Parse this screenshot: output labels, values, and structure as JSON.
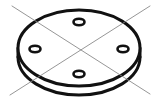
{
  "figure": {
    "title": "Circular disc with four holes",
    "background_color": "#ffffff",
    "line_color": "#111111",
    "hole_fill_color": "#ffffff",
    "construction_line_color": "#8a8a8a",
    "canvas": {
      "width": 160,
      "height": 107
    }
  },
  "disc": {
    "name": "disc-body",
    "top_face": {
      "name": "top-face-ellipse",
      "center_x": 79,
      "center_y": 48,
      "radius_x": 61,
      "radius_y": 38,
      "stroke_width": 3.0,
      "fill": "#ffffff"
    },
    "bottom_face": {
      "name": "bottom-face-arc",
      "center_x": 79,
      "center_y": 57,
      "radius_x": 61,
      "radius_y": 38,
      "stroke_width": 3.0
    },
    "thickness_px": 9,
    "side_wall_left_x": 18,
    "side_wall_right_x": 140
  },
  "holes": [
    {
      "name": "hole-top",
      "label": "hole 1",
      "cx": 79,
      "cy": 22,
      "rx": 5.5,
      "ry": 3.2
    },
    {
      "name": "hole-left",
      "label": "hole 2",
      "cx": 35,
      "cy": 49,
      "rx": 5.5,
      "ry": 3.2
    },
    {
      "name": "hole-right",
      "label": "hole 3",
      "cx": 123,
      "cy": 49,
      "rx": 5.5,
      "ry": 3.2
    },
    {
      "name": "hole-bottom",
      "label": "hole 4",
      "cx": 79,
      "cy": 74,
      "rx": 5.5,
      "ry": 3.2
    }
  ],
  "construction_lines": [
    {
      "name": "centerline-diagonal-a",
      "label": "diagonal centerline NW-SE",
      "x1": 12,
      "y1": 6,
      "x2": 150,
      "y2": 94,
      "stroke_width": 0.9
    },
    {
      "name": "centerline-diagonal-b",
      "label": "diagonal centerline NE-SW",
      "x1": 150,
      "y1": 6,
      "x2": 10,
      "y2": 95,
      "stroke_width": 0.9
    }
  ],
  "intersection_point": {
    "name": "centerline-intersection",
    "x": 79,
    "y": 50
  }
}
